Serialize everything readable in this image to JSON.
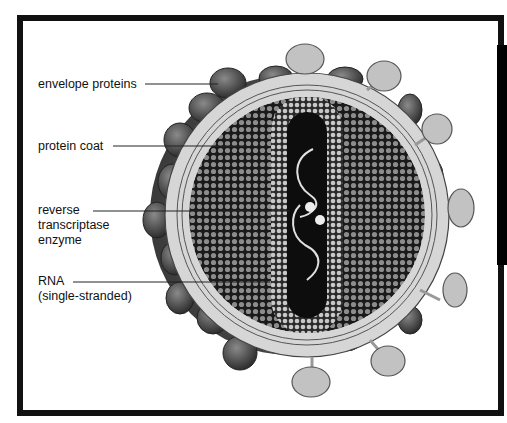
{
  "labels": [
    {
      "id": "envelope",
      "lines": [
        "envelope proteins"
      ]
    },
    {
      "id": "coat",
      "lines": [
        "protein coat"
      ]
    },
    {
      "id": "enzyme",
      "lines": [
        "reverse",
        "transcriptase",
        "enzyme"
      ]
    },
    {
      "id": "rna",
      "lines": [
        "RNA",
        "(single-stranded)"
      ]
    }
  ],
  "colors": {
    "frame": "#111111",
    "envelope_protein_dark": "#555555",
    "envelope_protein_light": "#c2c2c2",
    "membrane": "#d9d9d9",
    "capsid_dots": "#9a9a9a",
    "core": "#0d0d0d",
    "rna": "#e0e0e0"
  }
}
